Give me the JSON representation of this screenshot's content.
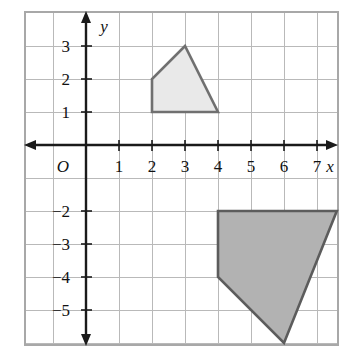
{
  "figure": {
    "origin_label": "O",
    "x_axis_name": "x",
    "y_axis_name": "y",
    "background_color": "#ffffff",
    "grid_color": "#b9b9b9",
    "axis_color": "#1a1a1a"
  },
  "axes": {
    "x_tick_labels": [
      "1",
      "2",
      "3",
      "4",
      "5",
      "6",
      "7"
    ],
    "x_tick_values": [
      1,
      2,
      3,
      4,
      5,
      6,
      7
    ],
    "y_tick_labels": [
      "3",
      "2",
      "1",
      "−2",
      "−3",
      "−4",
      "−5"
    ],
    "y_tick_values": [
      3,
      2,
      1,
      -2,
      -3,
      -4,
      -5
    ],
    "x_range": [
      -2,
      7.65
    ],
    "y_range": [
      -6.05,
      4.05
    ],
    "grid_spacing_units": 1,
    "grid_visible": true
  },
  "chart_data": {
    "type": "scatter",
    "xlabel": "x",
    "ylabel": "y",
    "xlim": [
      -2,
      7.65
    ],
    "ylim": [
      -6.05,
      4.05
    ],
    "grid": true,
    "legend": "none",
    "xticks": [
      1,
      2,
      3,
      4,
      5,
      6,
      7
    ],
    "yticks": [
      3,
      2,
      1,
      -2,
      -3,
      -4,
      -5
    ],
    "shapes": [
      {
        "name": "upper-quadrilateral",
        "kind": "polygon",
        "vertices": [
          [
            2,
            1
          ],
          [
            2,
            2
          ],
          [
            3,
            3
          ],
          [
            4,
            1
          ]
        ],
        "fill": "#e9e9e9",
        "stroke": "#707070"
      },
      {
        "name": "lower-quadrilateral",
        "kind": "polygon",
        "vertices": [
          [
            4,
            -2
          ],
          [
            7.6,
            -2
          ],
          [
            6,
            -6
          ],
          [
            4,
            -4
          ]
        ],
        "fill": "#b2b2b2",
        "stroke": "#5c5c5c"
      }
    ]
  },
  "shapes": {
    "upper": {
      "label": "upper-quadrilateral",
      "vertex_list": "(2, 1), (2, 2), (3, 3), (4, 1)",
      "fill_color": "#e9e9e9",
      "stroke_color": "#707070"
    },
    "lower": {
      "label": "lower-quadrilateral",
      "vertex_list": "(4, -2), (7.6, -2), (6, -6), (4, -4)",
      "fill_color": "#b2b2b2",
      "stroke_color": "#5c5c5c"
    }
  }
}
